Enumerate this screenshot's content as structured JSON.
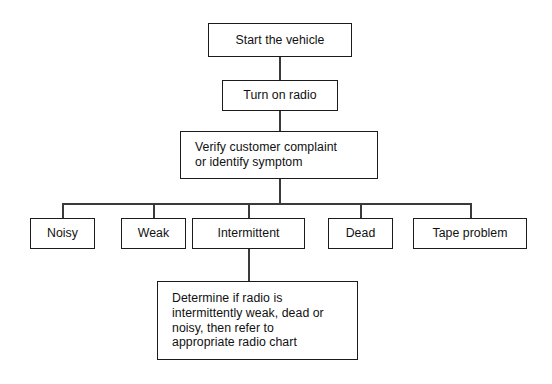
{
  "diagram": {
    "background_color": "#ffffff",
    "line_color": "#3a3a3a",
    "box_border_color": "#1b1b1b",
    "text_color": "#111111",
    "nodes": {
      "start": {
        "label": "Start the vehicle"
      },
      "turn_on_radio": {
        "label": "Turn on radio"
      },
      "verify": {
        "label": "Verify customer complaint\nor identify symptom"
      },
      "noisy": {
        "label": "Noisy"
      },
      "weak": {
        "label": "Weak"
      },
      "intermittent": {
        "label": "Intermittent"
      },
      "dead": {
        "label": "Dead"
      },
      "tape_problem": {
        "label": "Tape problem"
      },
      "determine": {
        "label": "Determine if radio is\nintermittently weak, dead or\nnoisy, then refer to\nappropriate radio chart"
      }
    }
  }
}
